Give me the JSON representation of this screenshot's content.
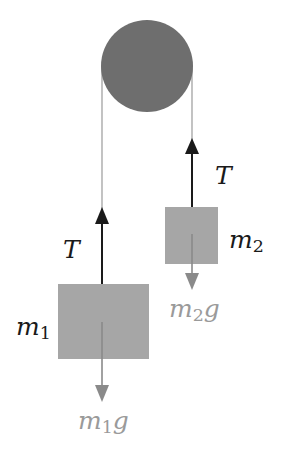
{
  "diagram": {
    "type": "atwood-machine",
    "colors": {
      "pulley": "#6e6e6e",
      "block": "#a6a6a6",
      "rope": "#9a9a9a",
      "tension_arrow": "#1a1a1a",
      "weight_arrow": "#8a8a8a",
      "weight_label": "#9a9a9a"
    },
    "labels": {
      "tension_left": "T",
      "tension_right": "T",
      "mass1": {
        "base": "m",
        "sub": "1"
      },
      "mass2": {
        "base": "m",
        "sub": "2"
      },
      "weight1": {
        "base": "m",
        "sub": "1",
        "suffix": "g"
      },
      "weight2": {
        "base": "m",
        "sub": "2",
        "suffix": "g"
      }
    }
  }
}
